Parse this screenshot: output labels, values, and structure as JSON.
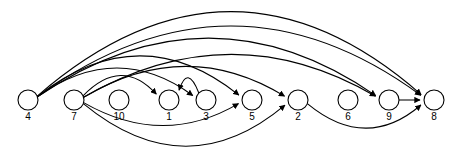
{
  "diagram": {
    "type": "directed-graph",
    "title": "",
    "background_color": "#ffffff",
    "stroke_color": "#000000",
    "node_fill": "#ffffff",
    "node_radius": 10,
    "baseline_y": 100,
    "nodes": [
      {
        "id": "4",
        "label": "4",
        "x": 28,
        "y": 100
      },
      {
        "id": "7",
        "label": "7",
        "x": 74,
        "y": 100
      },
      {
        "id": "10",
        "label": "10",
        "x": 119,
        "y": 100
      },
      {
        "id": "1",
        "label": "1",
        "x": 169,
        "y": 100
      },
      {
        "id": "3",
        "label": "3",
        "x": 206,
        "y": 100
      },
      {
        "id": "5",
        "label": "5",
        "x": 252,
        "y": 100
      },
      {
        "id": "2",
        "label": "2",
        "x": 298,
        "y": 100
      },
      {
        "id": "6",
        "label": "6",
        "x": 348,
        "y": 100
      },
      {
        "id": "9",
        "label": "9",
        "x": 389,
        "y": 100
      },
      {
        "id": "8",
        "label": "8",
        "x": 434,
        "y": 100
      }
    ],
    "edges": [
      {
        "from": "4",
        "to": "8",
        "side": "top",
        "height": 86
      },
      {
        "from": "4",
        "to": "8",
        "side": "top",
        "height": 72
      },
      {
        "from": "4",
        "to": "9",
        "side": "top",
        "height": 60
      },
      {
        "from": "4",
        "to": "5",
        "side": "top",
        "height": 42
      },
      {
        "from": "4",
        "to": "3",
        "side": "top",
        "height": 30
      },
      {
        "from": "7",
        "to": "9",
        "side": "top",
        "height": 44
      },
      {
        "from": "7",
        "to": "2",
        "side": "top",
        "height": 32
      },
      {
        "from": "7",
        "to": "1",
        "side": "top",
        "height": 22
      },
      {
        "from": "3",
        "to": "1",
        "side": "top",
        "height": 18
      },
      {
        "from": "7",
        "to": "5",
        "side": "bottom",
        "height": 24
      },
      {
        "from": "7",
        "to": "2",
        "side": "bottom",
        "height": 44
      },
      {
        "from": "2",
        "to": "8",
        "side": "bottom",
        "height": 26
      },
      {
        "from": "9",
        "to": "8",
        "side": "straight",
        "height": 0
      }
    ]
  }
}
